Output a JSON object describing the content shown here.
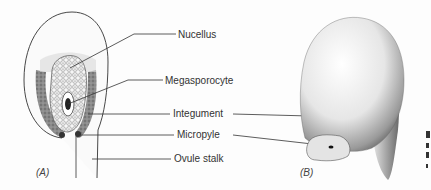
{
  "figure": {
    "panels": [
      {
        "id": "A",
        "label": "(A)"
      },
      {
        "id": "B",
        "label": "(B)"
      }
    ],
    "labels": {
      "nucellus": "Nucellus",
      "megasporocyte": "Megasporocyte",
      "integument": "Integument",
      "micropyle": "Micropyle",
      "ovule_stalk": "Ovule stalk"
    },
    "colors": {
      "line": "#333333",
      "shading": "#555555",
      "background": "#fdfdfd"
    }
  }
}
